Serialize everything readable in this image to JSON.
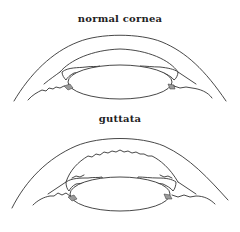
{
  "figure": {
    "panels": [
      {
        "id": "normal",
        "label": "normal cornea",
        "endothelium": "smooth"
      },
      {
        "id": "guttata",
        "label": "guttata",
        "endothelium": "irregular"
      }
    ],
    "colors": {
      "line": "#333333",
      "background": "#ffffff",
      "angle_shade": "#9a9a9a"
    }
  }
}
